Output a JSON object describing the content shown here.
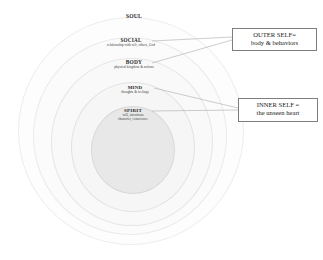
{
  "diagram": {
    "type": "concentric-onion",
    "background": "#ffffff",
    "layers": [
      {
        "id": "soul",
        "title": "SOUL",
        "subtitle": "",
        "label_cx": 134,
        "label_top": 14,
        "title_size": 5.6,
        "ellipse": {
          "cx": 131,
          "cy": 131,
          "rx": 113,
          "ry": 114,
          "fill": "#fdfdfd",
          "stroke": "#ededed"
        }
      },
      {
        "id": "social",
        "title": "SOCIAL",
        "subtitle": "relationship with self, others, God",
        "label_cx": 131,
        "label_top": 38,
        "title_size": 5.2,
        "ellipse": {
          "cx": 130,
          "cy": 136,
          "rx": 97,
          "ry": 99,
          "fill": "#fbfbfb",
          "stroke": "#eaeaea"
        }
      },
      {
        "id": "body",
        "title": "BODY",
        "subtitle": "physical kingdom & actions",
        "label_cx": 134,
        "label_top": 60,
        "title_size": 5.4,
        "ellipse": {
          "cx": 132,
          "cy": 142,
          "rx": 81,
          "ry": 84,
          "fill": "#f9f9f9",
          "stroke": "#e6e6e6"
        }
      },
      {
        "id": "mind",
        "title": "MIND",
        "subtitle": "thoughts & feelings",
        "label_cx": 135,
        "label_top": 85,
        "title_size": 5.0,
        "ellipse": {
          "cx": 133,
          "cy": 147,
          "rx": 62,
          "ry": 65,
          "fill": "#f6f6f6",
          "stroke": "#e2e2e2"
        }
      },
      {
        "id": "spirit",
        "title": "SPIRIT",
        "subtitle": "will, intentions",
        "subtitle2": "character, conscience",
        "label_cx": 133,
        "label_top": 108,
        "title_size": 5.0,
        "ellipse": {
          "cx": 133,
          "cy": 150,
          "rx": 42,
          "ry": 44,
          "fill": "#e8e8e8",
          "stroke": "#d8d8d8"
        }
      }
    ]
  },
  "callouts": [
    {
      "id": "outer-self",
      "line1": "OUTER SELF=",
      "line2": "body & behaviors",
      "x": 232,
      "y": 28,
      "w": 85,
      "h": 23,
      "font_size": 6.6,
      "border": "#7d7d7d"
    },
    {
      "id": "inner-self",
      "line1": "INNER SELF =",
      "line2": "the unseen heart",
      "x": 238,
      "y": 98,
      "w": 80,
      "h": 24,
      "font_size": 6.6,
      "border": "#7d7d7d"
    }
  ],
  "leader_lines": [
    {
      "id": "social-to-outer",
      "x1": 152,
      "y1": 41,
      "x2": 232,
      "y2": 37,
      "stroke": "#9a9a9a"
    },
    {
      "id": "body-to-outer",
      "x1": 152,
      "y1": 63,
      "x2": 232,
      "y2": 40,
      "stroke": "#9a9a9a"
    },
    {
      "id": "mind-to-inner",
      "x1": 154,
      "y1": 88,
      "x2": 238,
      "y2": 108,
      "stroke": "#9a9a9a"
    },
    {
      "id": "spirit-to-inner",
      "x1": 152,
      "y1": 111,
      "x2": 238,
      "y2": 110,
      "stroke": "#9a9a9a"
    }
  ]
}
